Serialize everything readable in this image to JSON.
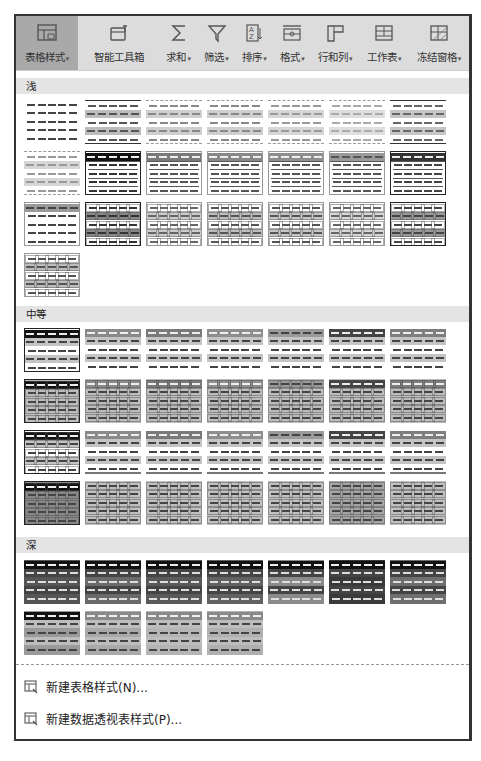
{
  "toolbar": {
    "buttons": [
      {
        "id": "table-style",
        "label": "表格样式",
        "has_dropdown": true,
        "active": true,
        "icon": "table-style-icon"
      },
      {
        "id": "smart-toolbox",
        "label": "智能工具箱",
        "has_dropdown": false,
        "active": false,
        "icon": "toolbox-icon"
      },
      {
        "id": "sum",
        "label": "求和",
        "has_dropdown": true,
        "active": false,
        "icon": "sigma-icon"
      },
      {
        "id": "filter",
        "label": "筛选",
        "has_dropdown": true,
        "active": false,
        "icon": "filter-icon"
      },
      {
        "id": "sort",
        "label": "排序",
        "has_dropdown": true,
        "active": false,
        "icon": "sort-az-icon"
      },
      {
        "id": "format",
        "label": "格式",
        "has_dropdown": true,
        "active": false,
        "icon": "format-icon"
      },
      {
        "id": "rows-cols",
        "label": "行和列",
        "has_dropdown": true,
        "active": false,
        "icon": "rows-cols-icon"
      },
      {
        "id": "worksheet",
        "label": "工作表",
        "has_dropdown": true,
        "active": false,
        "icon": "worksheet-icon"
      },
      {
        "id": "freeze-panes",
        "label": "冻结窗格",
        "has_dropdown": true,
        "active": false,
        "icon": "freeze-panes-icon"
      }
    ],
    "caret": "▾"
  },
  "sections": [
    {
      "id": "light",
      "label": "浅",
      "count": 22
    },
    {
      "id": "medium",
      "label": "中等",
      "count": 28
    },
    {
      "id": "dark",
      "label": "深",
      "count": 11
    }
  ],
  "menu": [
    {
      "id": "new-table-style",
      "label": "新建表格样式(N)...",
      "icon": "new-table-style-icon"
    },
    {
      "id": "new-pivot-style",
      "label": "新建数据透视表样式(P)...",
      "icon": "new-pivot-style-icon"
    }
  ],
  "colors": {
    "toolbar_bg": "#dcdcdc",
    "active_btn_bg": "#a9a9a9",
    "section_bg": "#e4e4e4",
    "frame": "#333333"
  }
}
